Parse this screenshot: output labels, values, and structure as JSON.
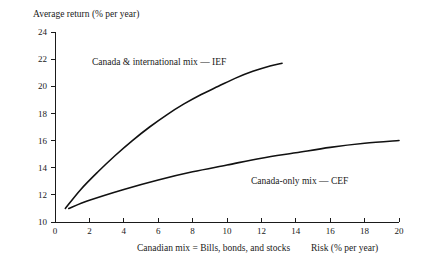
{
  "chart_data": {
    "type": "line",
    "title": "",
    "ylabel": "Average return (% per year)",
    "xlabel": "Risk (% per year)",
    "xlabel_left": "Canadian mix = Bills, bonds, and stocks",
    "xlim": [
      0,
      20
    ],
    "ylim": [
      10,
      24
    ],
    "grid": false,
    "legend": "inline-annotations",
    "x_ticks": [
      0,
      2,
      4,
      6,
      8,
      10,
      12,
      14,
      16,
      18,
      20
    ],
    "y_ticks": [
      10,
      12,
      14,
      16,
      18,
      20,
      22,
      24
    ],
    "series": [
      {
        "name": "Canada & international mix — IEF",
        "label": "Canada & international mix — IEF",
        "x": [
          0.6,
          1.5,
          2.5,
          3.5,
          4.5,
          5.5,
          6.5,
          7.5,
          8.5,
          9.5,
          10.5,
          11.5,
          12.5,
          13.2
        ],
        "y": [
          11.0,
          12.4,
          13.7,
          14.9,
          16.0,
          17.0,
          17.9,
          18.7,
          19.4,
          20.0,
          20.6,
          21.1,
          21.5,
          21.7
        ]
      },
      {
        "name": "Canada-only mix — CEF",
        "label": "Canada-only mix — CEF",
        "x": [
          0.8,
          2,
          4,
          6,
          8,
          10,
          12,
          14,
          16,
          18,
          20
        ],
        "y": [
          11.0,
          11.6,
          12.4,
          13.1,
          13.7,
          14.2,
          14.7,
          15.1,
          15.5,
          15.8,
          16.0
        ]
      }
    ],
    "annotations": [
      {
        "name": "ief-label",
        "text": "Canada & international mix — IEF",
        "x_px": 92,
        "y_px": 65
      },
      {
        "name": "cef-label",
        "text": "Canada-only mix — CEF",
        "x_px": 251,
        "y_px": 184
      }
    ]
  },
  "axis": {
    "y_title": "Average return (% per year)",
    "x_title_left": "Canadian mix = Bills, bonds, and stocks",
    "x_title_right": "Risk (% per year)"
  },
  "colors": {
    "background": "#ffffff",
    "axis": "#1a1a1a",
    "curve": "#111111",
    "text": "#1a1a1a"
  }
}
